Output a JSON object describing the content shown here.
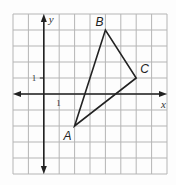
{
  "diagram": {
    "type": "coordinate-plane-triangle",
    "grid": {
      "x_min": -2,
      "x_max": 8,
      "y_min": -5,
      "y_max": 5,
      "step": 1,
      "cols": 10,
      "rows": 10
    },
    "axes": {
      "x_label": "x",
      "y_label": "y",
      "x_tick_label": "1",
      "y_tick_label": "1"
    },
    "vertices": [
      {
        "name": "A",
        "x": 2,
        "y": -2
      },
      {
        "name": "B",
        "x": 4,
        "y": 4
      },
      {
        "name": "C",
        "x": 6,
        "y": 1
      }
    ],
    "colors": {
      "grid": "#b5b5b5",
      "axis": "#222222",
      "triangle": "#222222"
    }
  }
}
